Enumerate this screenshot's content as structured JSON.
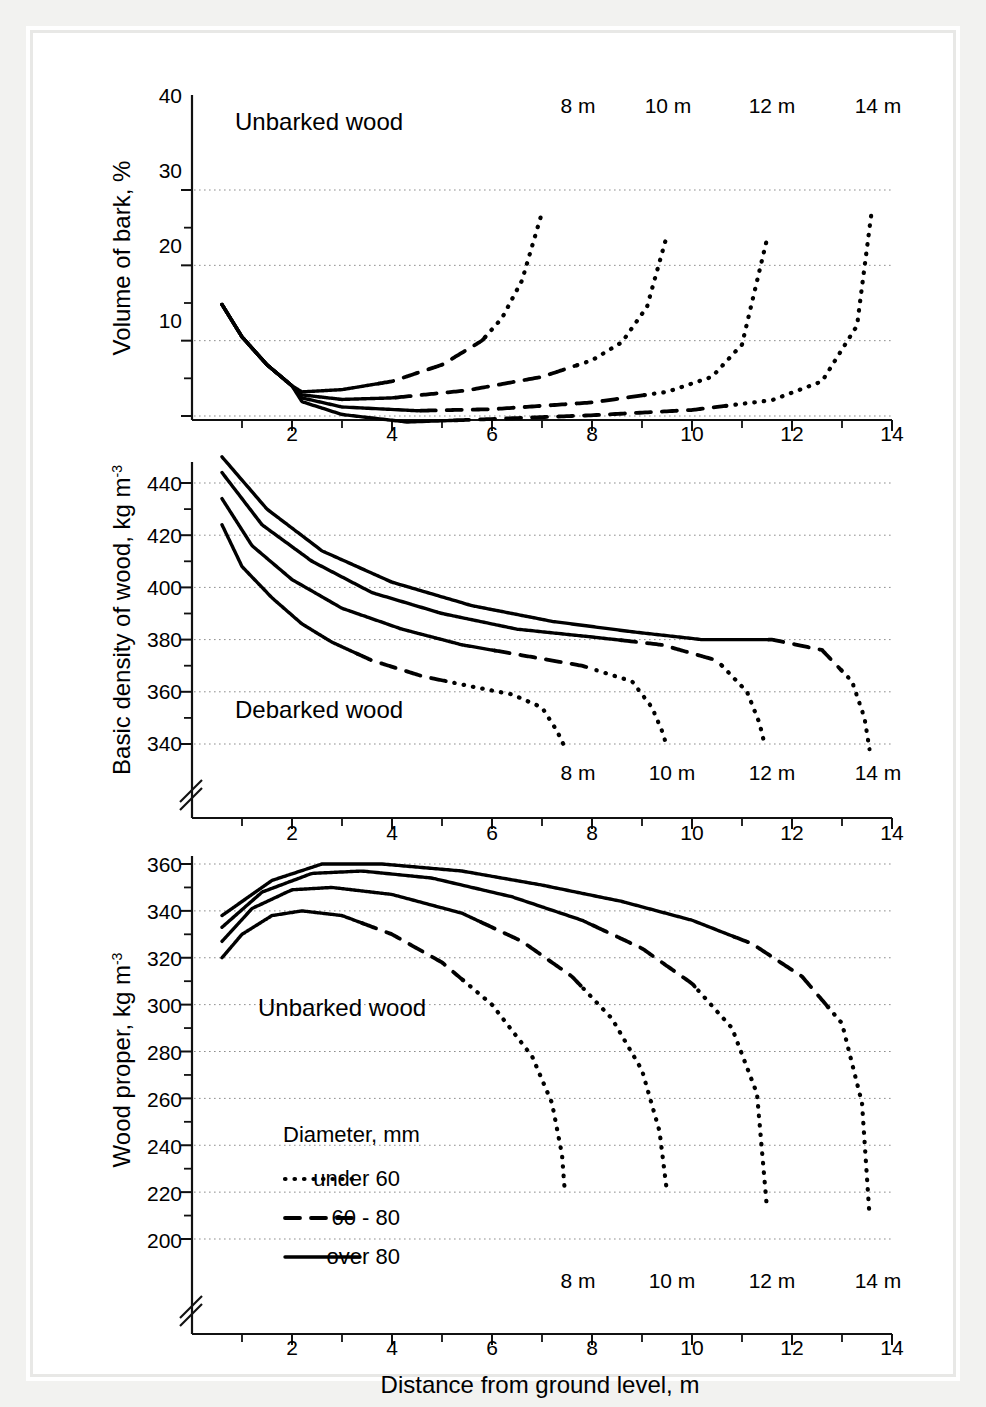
{
  "figure": {
    "x_axis_title": "Distance from ground level, m",
    "x_ticks": [
      "2",
      "4",
      "6",
      "8",
      "10",
      "12",
      "14"
    ],
    "height_labels": [
      "8 m",
      "10 m",
      "12 m",
      "14 m"
    ]
  },
  "legend": {
    "title": "Diameter, mm",
    "items": [
      {
        "label": "under 60",
        "style": "dotted"
      },
      {
        "label": "60 - 80",
        "style": "dashed"
      },
      {
        "label": "over 80",
        "style": "solid"
      }
    ]
  },
  "panels": {
    "top": {
      "y_title_text": "Volume of bark, %",
      "annotation": "Unbarked wood",
      "y_ticks": [
        "10",
        "20",
        "30",
        "40"
      ]
    },
    "middle": {
      "y_title_main": "Basic density of wood, kg m",
      "y_title_sup": "-3",
      "annotation": "Debarked wood",
      "y_ticks": [
        "340",
        "360",
        "380",
        "400",
        "420",
        "440"
      ]
    },
    "bottom": {
      "y_title_main": "Wood proper, kg m",
      "y_title_sup": "-3",
      "annotation": "Unbarked wood",
      "y_ticks": [
        "200",
        "220",
        "240",
        "260",
        "280",
        "300",
        "320",
        "340",
        "360"
      ]
    }
  },
  "chart_data": [
    {
      "type": "line",
      "title": "Volume of bark, %",
      "panel": "top",
      "xlabel": "Distance from ground level, m",
      "ylabel": "Volume of bark, %",
      "xlim": [
        0,
        14
      ],
      "ylim": [
        0,
        40
      ],
      "grid": true,
      "annotation": "Unbarked wood",
      "legend_position": "bottom-panel",
      "series": [
        {
          "name": "8 m",
          "x": [
            0.6,
            1.0,
            1.5,
            2.0,
            2.2,
            3.0,
            4.0,
            5.0,
            5.8,
            6.2,
            6.6,
            7.0
          ],
          "values": [
            24.8,
            20.5,
            16.8,
            14.0,
            13.2,
            13.5,
            14.6,
            16.8,
            20.0,
            23.0,
            28.0,
            37.0
          ],
          "style_by_diameter": [
            "solid",
            "dashed",
            "dotted"
          ]
        },
        {
          "name": "10 m",
          "x": [
            0.6,
            1.0,
            1.5,
            2.0,
            2.2,
            3.0,
            4.0,
            5.5,
            7.0,
            8.0,
            8.6,
            9.1,
            9.5
          ],
          "values": [
            24.8,
            20.5,
            16.8,
            14.0,
            12.8,
            12.2,
            12.4,
            13.4,
            15.2,
            17.4,
            19.8,
            24.5,
            34.0
          ],
          "style_by_diameter": [
            "solid",
            "dashed",
            "dotted"
          ]
        },
        {
          "name": "12 m",
          "x": [
            0.6,
            1.0,
            1.5,
            2.0,
            2.2,
            3.0,
            4.5,
            6.0,
            8.0,
            9.5,
            10.4,
            11.0,
            11.5
          ],
          "values": [
            24.8,
            20.5,
            16.8,
            14.0,
            12.4,
            11.2,
            10.7,
            10.9,
            11.8,
            13.2,
            15.2,
            19.5,
            33.5
          ],
          "style_by_diameter": [
            "solid",
            "dashed",
            "dotted"
          ]
        },
        {
          "name": "14 m",
          "x": [
            0.6,
            1.0,
            1.5,
            2.0,
            2.2,
            3.0,
            4.3,
            6.0,
            8.0,
            10.0,
            11.6,
            12.6,
            13.3,
            13.6
          ],
          "values": [
            24.8,
            20.5,
            16.8,
            14.0,
            11.9,
            10.2,
            9.2,
            9.6,
            10.1,
            10.8,
            12.1,
            14.6,
            22.0,
            37.5
          ],
          "style_by_diameter": [
            "solid",
            "dashed",
            "dotted"
          ]
        }
      ]
    },
    {
      "type": "line",
      "title": "Basic density of wood, kg m-3",
      "panel": "middle",
      "xlabel": "Distance from ground level, m",
      "ylabel": "Basic density of wood, kg m-3",
      "xlim": [
        0,
        14
      ],
      "ylim": [
        330,
        450
      ],
      "axis_break": true,
      "grid": true,
      "annotation": "Debarked wood",
      "series": [
        {
          "name": "8 m",
          "x": [
            0.6,
            1.0,
            1.6,
            2.2,
            2.8,
            3.6,
            4.6,
            5.6,
            6.4,
            7.0,
            7.3,
            7.45
          ],
          "values": [
            424,
            408,
            396,
            386,
            379,
            372,
            366,
            362,
            359,
            354,
            345,
            339
          ],
          "style_by_diameter": [
            "solid",
            "dashed",
            "dotted"
          ]
        },
        {
          "name": "10 m",
          "x": [
            0.6,
            1.2,
            2.0,
            3.0,
            4.2,
            5.4,
            6.6,
            7.8,
            8.8,
            9.2,
            9.4,
            9.5
          ],
          "values": [
            434,
            416,
            403,
            392,
            384,
            378,
            374,
            370,
            364,
            354,
            345,
            339
          ],
          "style_by_diameter": [
            "solid",
            "dashed",
            "dotted"
          ]
        },
        {
          "name": "12 m",
          "x": [
            0.6,
            1.4,
            2.4,
            3.6,
            5.0,
            6.5,
            8.0,
            9.4,
            10.5,
            11.1,
            11.35,
            11.45
          ],
          "values": [
            444,
            424,
            410,
            398,
            390,
            384,
            381,
            378,
            372,
            360,
            348,
            340
          ],
          "style_by_diameter": [
            "solid",
            "dashed",
            "dotted"
          ]
        },
        {
          "name": "14 m",
          "x": [
            0.6,
            1.5,
            2.6,
            4.0,
            5.6,
            7.2,
            8.8,
            10.2,
            11.6,
            12.6,
            13.2,
            13.45,
            13.55
          ],
          "values": [
            450,
            430,
            414,
            402,
            393,
            387,
            383,
            380,
            380,
            376,
            364,
            350,
            338
          ],
          "style_by_diameter": [
            "solid",
            "dashed",
            "dotted"
          ]
        }
      ]
    },
    {
      "type": "line",
      "title": "Wood proper, kg m-3",
      "panel": "bottom",
      "xlabel": "Distance from ground level, m",
      "ylabel": "Wood proper, kg m-3",
      "xlim": [
        0,
        14
      ],
      "ylim": [
        195,
        365
      ],
      "axis_break": true,
      "grid": true,
      "annotation": "Unbarked wood",
      "series": [
        {
          "name": "8 m",
          "x": [
            0.6,
            1.0,
            1.6,
            2.2,
            3.0,
            4.0,
            5.0,
            6.0,
            6.8,
            7.2,
            7.4,
            7.45
          ],
          "values": [
            320,
            330,
            338,
            340,
            338,
            330,
            318,
            300,
            278,
            258,
            236,
            222
          ],
          "style_by_diameter": [
            "solid",
            "dashed",
            "dotted"
          ]
        },
        {
          "name": "10 m",
          "x": [
            0.6,
            1.2,
            2.0,
            2.8,
            4.0,
            5.4,
            6.6,
            7.6,
            8.4,
            9.0,
            9.35,
            9.5
          ],
          "values": [
            327,
            341,
            349,
            350,
            347,
            339,
            327,
            312,
            294,
            272,
            246,
            220
          ],
          "style_by_diameter": [
            "solid",
            "dashed",
            "dotted"
          ]
        },
        {
          "name": "12 m",
          "x": [
            0.6,
            1.4,
            2.4,
            3.4,
            4.8,
            6.4,
            7.8,
            9.0,
            10.0,
            10.8,
            11.3,
            11.5
          ],
          "values": [
            333,
            348,
            356,
            357,
            354,
            346,
            336,
            324,
            309,
            290,
            262,
            213
          ],
          "style_by_diameter": [
            "solid",
            "dashed",
            "dotted"
          ]
        },
        {
          "name": "14 m",
          "x": [
            0.6,
            1.6,
            2.6,
            3.8,
            5.4,
            7.0,
            8.6,
            10.0,
            11.2,
            12.2,
            13.0,
            13.4,
            13.55
          ],
          "values": [
            338,
            353,
            360,
            360,
            357,
            351,
            344,
            336,
            326,
            312,
            292,
            258,
            210
          ],
          "style_by_diameter": [
            "solid",
            "dashed",
            "dotted"
          ]
        }
      ]
    }
  ]
}
